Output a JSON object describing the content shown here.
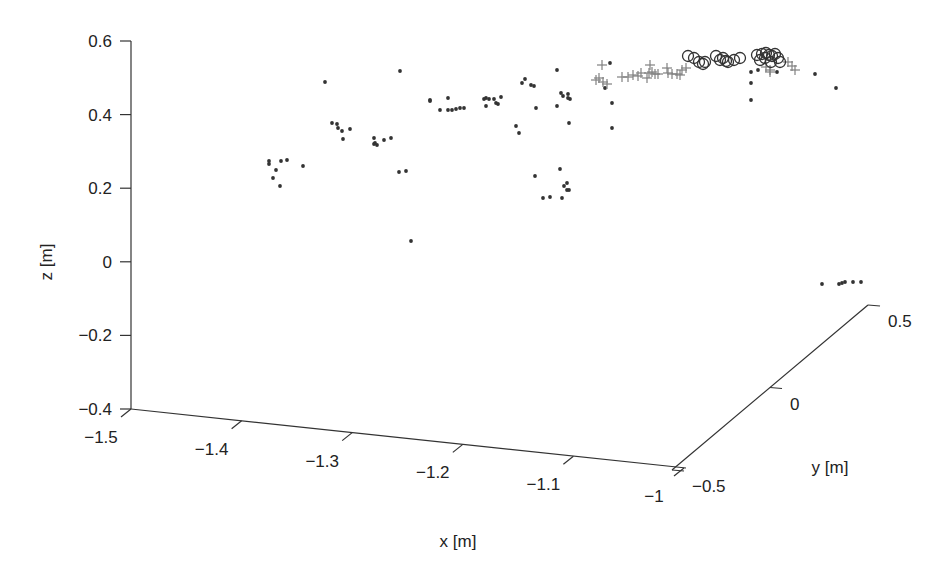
{
  "chart_data": {
    "type": "scatter",
    "dimensions": "3d",
    "title": "",
    "xlabel": "x [m]",
    "ylabel": "y [m]",
    "zlabel": "z [m]",
    "xlim": [
      -1.5,
      -1.0
    ],
    "ylim": [
      -0.5,
      0.5
    ],
    "zlim": [
      -0.4,
      0.6
    ],
    "x_ticks": [
      "-1.5",
      "-1.4",
      "-1.3",
      "-1.2",
      "-1.1",
      "-1"
    ],
    "y_ticks": [
      "-0.5",
      "0",
      "0.5"
    ],
    "z_ticks": [
      "0.6",
      "0.4",
      "0.2",
      "0",
      "-0.2",
      "-0.4"
    ],
    "grid": false,
    "legend": null,
    "colors": {
      "dots": "#333333",
      "plus": "#808080",
      "circles": "#333333",
      "axes": "#333333"
    },
    "series": [
      {
        "name": "dots",
        "marker": "filled-dot",
        "note": "screen-projected [px, py] positions",
        "points": [
          [
            269,
            161
          ],
          [
            269,
            164
          ],
          [
            281,
            161
          ],
          [
            287,
            160
          ],
          [
            276,
            170
          ],
          [
            273,
            178
          ],
          [
            280,
            186
          ],
          [
            303,
            166
          ],
          [
            325,
            82
          ],
          [
            332,
            123
          ],
          [
            337,
            124
          ],
          [
            338,
            128
          ],
          [
            342,
            131
          ],
          [
            350,
            129
          ],
          [
            343,
            139
          ],
          [
            374,
            138
          ],
          [
            375,
            143
          ],
          [
            377,
            145
          ],
          [
            384,
            140
          ],
          [
            391,
            138
          ],
          [
            374,
            144
          ],
          [
            399,
            172
          ],
          [
            406,
            171
          ],
          [
            411,
            241
          ],
          [
            400,
            71
          ],
          [
            430,
            100
          ],
          [
            430,
            101
          ],
          [
            448,
            98
          ],
          [
            448,
            110
          ],
          [
            452,
            110
          ],
          [
            456,
            109
          ],
          [
            460,
            108
          ],
          [
            464,
            108
          ],
          [
            440,
            110
          ],
          [
            484,
            99
          ],
          [
            486,
            98
          ],
          [
            489,
            99
          ],
          [
            494,
            99
          ],
          [
            496,
            103
          ],
          [
            486,
            106
          ],
          [
            498,
            104
          ],
          [
            501,
            97
          ],
          [
            516,
            126
          ],
          [
            519,
            133
          ],
          [
            522,
            83
          ],
          [
            525,
            79
          ],
          [
            531,
            85
          ],
          [
            534,
            86
          ],
          [
            536,
            108
          ],
          [
            543,
            198
          ],
          [
            550,
            197
          ],
          [
            562,
            198
          ],
          [
            564,
            186
          ],
          [
            567,
            190
          ],
          [
            569,
            190
          ],
          [
            567,
            183
          ],
          [
            560,
            169
          ],
          [
            535,
            176
          ],
          [
            557,
            106
          ],
          [
            557,
            70
          ],
          [
            561,
            93
          ],
          [
            563,
            96
          ],
          [
            568,
            94
          ],
          [
            570,
            99
          ],
          [
            568,
            98
          ],
          [
            569,
            123
          ],
          [
            612,
            103
          ],
          [
            612,
            128
          ],
          [
            605,
            88
          ],
          [
            610,
            63
          ],
          [
            751,
            72
          ],
          [
            751,
            83
          ],
          [
            751,
            100
          ],
          [
            758,
            70
          ],
          [
            777,
            72
          ],
          [
            815,
            74
          ],
          [
            836,
            88
          ],
          [
            822,
            284
          ],
          [
            839,
            284
          ],
          [
            842,
            283
          ],
          [
            845,
            282
          ],
          [
            853,
            282
          ],
          [
            861,
            282
          ]
        ]
      },
      {
        "name": "plus",
        "marker": "plus",
        "points": [
          [
            602,
            65
          ],
          [
            599,
            78
          ],
          [
            596,
            80
          ],
          [
            603,
            82
          ],
          [
            607,
            84
          ],
          [
            622,
            77
          ],
          [
            628,
            77
          ],
          [
            633,
            75
          ],
          [
            638,
            76
          ],
          [
            641,
            73
          ],
          [
            647,
            78
          ],
          [
            649,
            73
          ],
          [
            650,
            65
          ],
          [
            652,
            72
          ],
          [
            655,
            74
          ],
          [
            658,
            74
          ],
          [
            667,
            68
          ],
          [
            668,
            73
          ],
          [
            672,
            74
          ],
          [
            677,
            74
          ],
          [
            680,
            75
          ],
          [
            682,
            70
          ],
          [
            686,
            68
          ],
          [
            766,
            67
          ],
          [
            770,
            70
          ],
          [
            788,
            62
          ],
          [
            792,
            66
          ],
          [
            795,
            70
          ],
          [
            770,
            72
          ]
        ]
      },
      {
        "name": "circles",
        "marker": "open-circle",
        "points": [
          [
            688,
            56
          ],
          [
            694,
            58
          ],
          [
            699,
            62
          ],
          [
            703,
            64
          ],
          [
            705,
            62
          ],
          [
            716,
            56
          ],
          [
            720,
            60
          ],
          [
            723,
            58
          ],
          [
            726,
            61
          ],
          [
            728,
            62
          ],
          [
            734,
            60
          ],
          [
            740,
            58
          ],
          [
            757,
            55
          ],
          [
            762,
            54
          ],
          [
            766,
            53
          ],
          [
            769,
            55
          ],
          [
            772,
            56
          ],
          [
            775,
            54
          ],
          [
            778,
            58
          ],
          [
            771,
            62
          ],
          [
            765,
            58
          ],
          [
            760,
            60
          ],
          [
            780,
            62
          ]
        ]
      }
    ]
  }
}
